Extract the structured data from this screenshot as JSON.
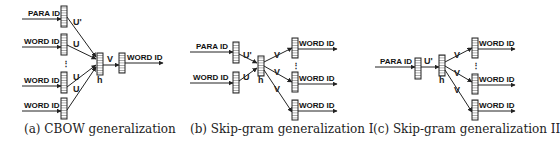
{
  "figure": {
    "panels": [
      {
        "id": "a",
        "caption": "(a) CBOW generalization",
        "inputs": [
          {
            "label": "PARA ID",
            "weight": "U'"
          },
          {
            "label": "WORD ID",
            "weight": "U"
          },
          {
            "label": "WORD ID",
            "weight": "U"
          },
          {
            "label": "WORD ID",
            "weight": "U"
          }
        ],
        "ellipsis": "⋮",
        "hidden_label": "h",
        "output_weight": "V",
        "outputs": [
          {
            "label": "WORD ID"
          }
        ]
      },
      {
        "id": "b",
        "caption": "(b) Skip-gram generalization I",
        "inputs": [
          {
            "label": "PARA ID",
            "weight": "U'"
          },
          {
            "label": "WORD ID",
            "weight": "U"
          }
        ],
        "hidden_label": "h",
        "ellipsis": "⋮",
        "outputs": [
          {
            "label": "WORD ID",
            "weight": "V"
          },
          {
            "label": "WORD ID",
            "weight": "V"
          },
          {
            "label": "WORD ID",
            "weight": "V"
          }
        ]
      },
      {
        "id": "c",
        "caption": "(c) Skip-gram generalization II",
        "inputs": [
          {
            "label": "PARA ID",
            "weight": "U'"
          }
        ],
        "hidden_label": "h",
        "ellipsis": "⋮",
        "outputs": [
          {
            "label": "WORD ID",
            "weight": "V"
          },
          {
            "label": "WORD ID",
            "weight": "V"
          },
          {
            "label": "WORD ID",
            "weight": "V"
          }
        ]
      }
    ]
  }
}
